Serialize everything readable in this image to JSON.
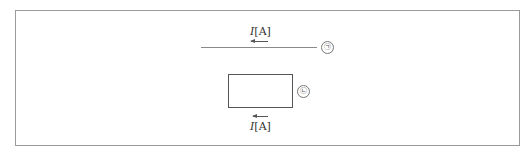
{
  "diagram": {
    "top_label": {
      "symbol": "I",
      "unit": "[A]"
    },
    "bottom_label": {
      "symbol": "I",
      "unit": "[A]"
    },
    "wire_marker": "㉠",
    "loop_marker": "㉡",
    "top_current_direction": "left",
    "bottom_current_direction": "left"
  }
}
